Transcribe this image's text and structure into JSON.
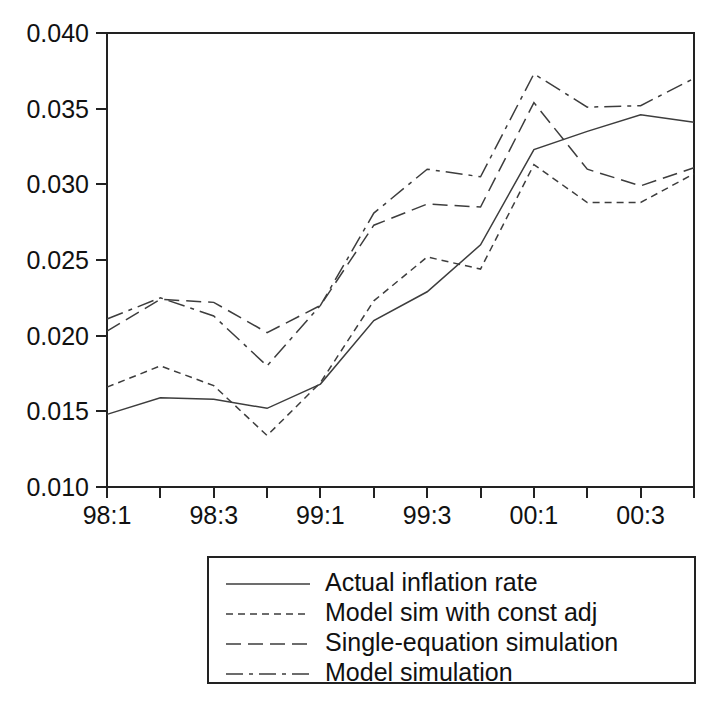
{
  "chart_data": {
    "type": "line",
    "title": "",
    "subtitle": "",
    "xlabel": "",
    "ylabel": "",
    "xlim": [
      0,
      11
    ],
    "ylim": [
      0.01,
      0.04
    ],
    "grid": false,
    "legend_position": "below-center",
    "x": [
      "98:1",
      "98:2",
      "98:3",
      "98:4",
      "99:1",
      "99:2",
      "99:3",
      "99:4",
      "00:1",
      "00:2",
      "00:3",
      "00:4"
    ],
    "x_tick_labels": [
      "98:1",
      "",
      "98:3",
      "",
      "99:1",
      "",
      "99:3",
      "",
      "00:1",
      "",
      "00:3",
      ""
    ],
    "y_tick_labels": [
      "0.010",
      "0.015",
      "0.020",
      "0.025",
      "0.030",
      "0.035",
      "0.040"
    ],
    "y_ticks": [
      0.01,
      0.015,
      0.02,
      0.025,
      0.03,
      0.035,
      0.04
    ],
    "series": [
      {
        "name": "Actual inflation rate",
        "dash": "solid",
        "values": [
          0.0148,
          0.0159,
          0.0158,
          0.0152,
          0.0168,
          0.021,
          0.0229,
          0.026,
          0.0323,
          0.0335,
          0.0346,
          0.0341
        ]
      },
      {
        "name": "Model sim with const adj",
        "dash": "dotted",
        "values": [
          0.0166,
          0.018,
          0.0167,
          0.0134,
          0.0169,
          0.0223,
          0.0252,
          0.0244,
          0.0313,
          0.0288,
          0.0288,
          0.0307
        ]
      },
      {
        "name": "Single-equation simulation",
        "dash": "dashed",
        "values": [
          0.0203,
          0.0224,
          0.0222,
          0.0202,
          0.022,
          0.0273,
          0.0287,
          0.0285,
          0.0354,
          0.031,
          0.0299,
          0.0311
        ]
      },
      {
        "name": "Model simulation",
        "dash": "dashdot",
        "values": [
          0.0211,
          0.0225,
          0.0213,
          0.018,
          0.022,
          0.0281,
          0.031,
          0.0305,
          0.0373,
          0.0351,
          0.0352,
          0.037
        ]
      }
    ]
  },
  "legend": {
    "entries": [
      {
        "label": "Actual inflation rate",
        "dash": "solid"
      },
      {
        "label": "Model sim with const adj",
        "dash": "dotted"
      },
      {
        "label": "Single-equation simulation",
        "dash": "dashed"
      },
      {
        "label": "Model simulation",
        "dash": "dashdot"
      }
    ]
  },
  "colors": {
    "line": "#3d3d3d",
    "axis": "#222222",
    "text": "#111111",
    "background": "#ffffff"
  }
}
